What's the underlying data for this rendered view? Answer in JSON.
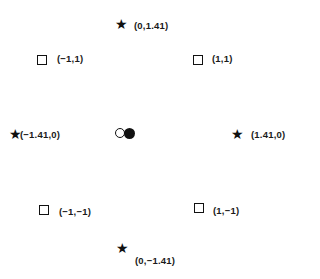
{
  "diagram": {
    "type": "central-composite-design",
    "factorial_points": [
      {
        "label": "(−1,1)",
        "x": -1,
        "y": 1,
        "marker": "square"
      },
      {
        "label": "(1,1)",
        "x": 1,
        "y": 1,
        "marker": "square"
      },
      {
        "label": "(−1,−1)",
        "x": -1,
        "y": -1,
        "marker": "square"
      },
      {
        "label": "(1,−1)",
        "x": 1,
        "y": -1,
        "marker": "square"
      }
    ],
    "axial_points": [
      {
        "label": "(0,1.41)",
        "x": 0,
        "y": 1.41,
        "marker": "star"
      },
      {
        "label": "(−1.41,0)",
        "x": -1.41,
        "y": 0,
        "marker": "star"
      },
      {
        "label": "(1.41,0)",
        "x": 1.41,
        "y": 0,
        "marker": "star"
      },
      {
        "label": "(0,−1.41)",
        "x": 0,
        "y": -1.41,
        "marker": "star"
      }
    ],
    "center_points": [
      {
        "marker": "open-circle"
      },
      {
        "marker": "filled-circle"
      }
    ],
    "star_glyph": "★"
  }
}
